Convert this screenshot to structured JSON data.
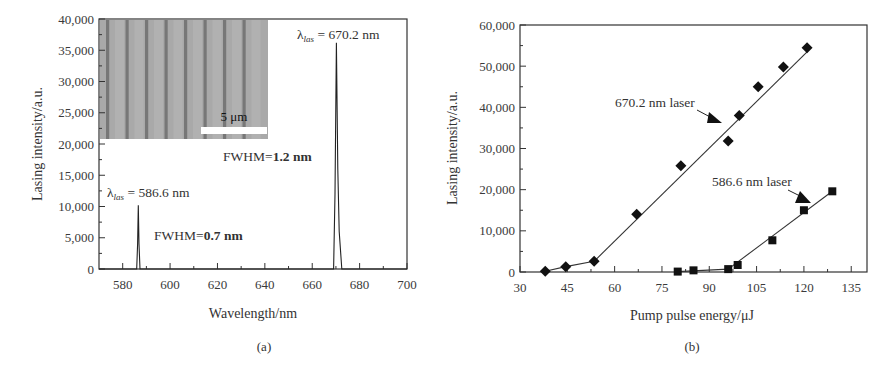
{
  "chart_data": [
    {
      "panel": "(a)",
      "type": "line",
      "title": "",
      "xlabel": "Wavelength/nm",
      "ylabel": "Lasing intensity/a.u.",
      "xlim": [
        570,
        700
      ],
      "ylim": [
        0,
        40000
      ],
      "xticks": [
        580,
        600,
        620,
        640,
        660,
        680,
        700
      ],
      "xtick_labels": [
        "580",
        "600",
        "620",
        "640",
        "660",
        "680",
        "700"
      ],
      "yticks": [
        0,
        5000,
        10000,
        15000,
        20000,
        25000,
        30000,
        35000,
        40000
      ],
      "ytick_labels": [
        "0",
        "5,000",
        "10,000",
        "15,000",
        "20,000",
        "25,000",
        "30,000",
        "35,000",
        "40,000"
      ],
      "grid": false,
      "series": [
        {
          "name": "Lasing spectrum",
          "x": [
            570,
            585.9,
            586.3,
            586.6,
            586.9,
            587.3,
            669.0,
            669.6,
            670.2,
            670.8,
            671.4,
            672.5,
            700
          ],
          "y": [
            0,
            0,
            4000,
            10200,
            4000,
            0,
            0,
            12000,
            36200,
            16000,
            6000,
            0,
            0
          ]
        }
      ],
      "peaks": [
        {
          "wavelength": 586.6,
          "intensity": 10200,
          "fwhm_nm": 0.7
        },
        {
          "wavelength": 670.2,
          "intensity": 36200,
          "fwhm_nm": 1.2
        }
      ],
      "annotations": [
        {
          "symbol": "λ",
          "subscript": "las",
          "text": " = 586.6 nm"
        },
        {
          "prefix": "FWHM=",
          "value": "0.7 nm"
        },
        {
          "symbol": "λ",
          "subscript": "las",
          "text": " = 670.2 nm"
        },
        {
          "prefix": "FWHM=",
          "value": "1.2 nm"
        }
      ],
      "inset": {
        "description": "micrograph of periodic stripes",
        "scale_bar": "5 μm"
      },
      "caption": "(a)"
    },
    {
      "panel": "(b)",
      "type": "scatter",
      "title": "",
      "xlabel": "Pump pulse energy/μJ",
      "ylabel": "Lasing intensity/a.u.",
      "xlim": [
        30,
        140
      ],
      "ylim": [
        0,
        60000
      ],
      "xticks": [
        30,
        45,
        60,
        75,
        90,
        105,
        120,
        135
      ],
      "xtick_labels": [
        "30",
        "45",
        "60",
        "75",
        "90",
        "105",
        "120",
        "135"
      ],
      "yticks": [
        0,
        10000,
        20000,
        30000,
        40000,
        50000,
        60000
      ],
      "ytick_labels": [
        "0",
        "10,000",
        "20,000",
        "30,000",
        "40,000",
        "50,000",
        "60,000"
      ],
      "grid": false,
      "series": [
        {
          "name": "670.2 nm laser",
          "marker": "diamond",
          "x": [
            38,
            44.5,
            53.5,
            67,
            81,
            96,
            99.5,
            105.5,
            113.5,
            121
          ],
          "y": [
            200,
            1300,
            2600,
            14000,
            25800,
            31800,
            38000,
            45000,
            49800,
            54500
          ],
          "fit_lines": [
            {
              "x": [
                38,
                44.5,
                53.5
              ],
              "y": [
                200,
                1300,
                2600
              ]
            },
            {
              "x": [
                53.5,
                121
              ],
              "y": [
                2600,
                53500
              ]
            }
          ]
        },
        {
          "name": "586.6 nm laser",
          "marker": "square",
          "x": [
            80,
            85,
            96,
            99,
            110,
            120,
            129
          ],
          "y": [
            100,
            400,
            700,
            1700,
            7700,
            15000,
            19600
          ],
          "fit_lines": [
            {
              "x": [
                80,
                96
              ],
              "y": [
                100,
                700
              ]
            },
            {
              "x": [
                96,
                129
              ],
              "y": [
                700,
                19600
              ]
            }
          ]
        }
      ],
      "annotations": [
        {
          "text": "670.2 nm laser",
          "arrow": true
        },
        {
          "text": "586.6 nm laser",
          "arrow": true
        }
      ],
      "caption": "(b)"
    }
  ]
}
